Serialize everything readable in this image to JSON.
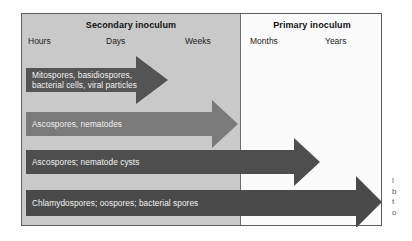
{
  "figure": {
    "panels": [
      {
        "id": "secondary",
        "title": "Secondary inoculum"
      },
      {
        "id": "primary",
        "title": "Primary inoculum"
      }
    ],
    "time_axis": {
      "ticks": [
        "Hours",
        "Days",
        "Weeks",
        "Months",
        "Years"
      ]
    },
    "arrows": [
      {
        "label": "Mitospores, basidiospores,\nbacterial cells, viral particles",
        "color": "#545454",
        "ends_at": "Weeks"
      },
      {
        "label": "Ascospores, nematodes",
        "color": "#7a7a7a",
        "ends_at": "Weeks"
      },
      {
        "label": "Ascospores; nematode cysts",
        "color": "#4e4e4e",
        "ends_at": "Months"
      },
      {
        "label": "Chlamydospores; oospores; bacterial spores",
        "color": "#4a4a4a",
        "ends_at": "Years"
      }
    ],
    "caption_fragment": [
      "l",
      "b",
      "t",
      "o"
    ],
    "colors": {
      "panel_secondary": "#c9c9c9",
      "panel_primary": "#fbfbfb",
      "frame_border": "#5d5d5d",
      "divider": "#6e6e6e",
      "label_text": "#f2f2f2"
    }
  }
}
